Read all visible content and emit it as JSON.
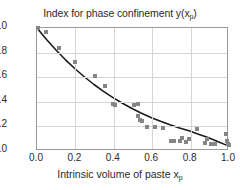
{
  "chart_data": {
    "type": "scatter",
    "title": "Index for phase confinement y(x",
    "title_sub": "p",
    "title_tail": ")",
    "xlabel": "Intrinsic volume of paste x",
    "xlabel_sub": "p",
    "ylabel": "",
    "xlim": [
      0.0,
      1.0
    ],
    "ylim": [
      0.0,
      1.0
    ],
    "xticks": [
      "0.0",
      "0.2",
      "0.4",
      "0.6",
      "0.8",
      "1.0"
    ],
    "xtick_values": [
      0.0,
      0.2,
      0.4,
      0.6,
      0.8,
      1.0
    ],
    "yticks": [
      "0.0",
      "0.2",
      "0.4",
      "0.6",
      "0.8",
      "1.0"
    ],
    "ytick_values": [
      0.0,
      0.2,
      0.4,
      0.6,
      0.8,
      1.0
    ],
    "grid": true,
    "legend": null,
    "marker_color": "#858585",
    "curve_color": "#1a1a1a",
    "grid_color": "#d5d5d5",
    "frame_color": "#9a9a9a",
    "series": [
      {
        "name": "measured index",
        "marker": "square",
        "points": [
          [
            0.005,
            1.0
          ],
          [
            0.045,
            0.965
          ],
          [
            0.115,
            0.84
          ],
          [
            0.2,
            0.72
          ],
          [
            0.3,
            0.61
          ],
          [
            0.355,
            0.525
          ],
          [
            0.395,
            0.385
          ],
          [
            0.405,
            0.375
          ],
          [
            0.505,
            0.375
          ],
          [
            0.525,
            0.385
          ],
          [
            0.525,
            0.285
          ],
          [
            0.535,
            0.255
          ],
          [
            0.545,
            0.245
          ],
          [
            0.575,
            0.195
          ],
          [
            0.615,
            0.195
          ],
          [
            0.655,
            0.185
          ],
          [
            0.7,
            0.085
          ],
          [
            0.715,
            0.085
          ],
          [
            0.745,
            0.085
          ],
          [
            0.755,
            0.105
          ],
          [
            0.775,
            0.075
          ],
          [
            0.79,
            0.095
          ],
          [
            0.835,
            0.175
          ],
          [
            0.875,
            0.065
          ],
          [
            0.885,
            0.095
          ],
          [
            0.905,
            0.055
          ],
          [
            0.925,
            0.055
          ],
          [
            0.985,
            0.135
          ],
          [
            0.99,
            0.085
          ],
          [
            0.995,
            0.055
          ],
          [
            1.0,
            0.045
          ]
        ]
      }
    ],
    "fit_curve": {
      "name": "fitted decay",
      "description": "monotonic exponential-like decay from 1.0 to about 0.03",
      "x": [
        0.0,
        0.05,
        0.1,
        0.15,
        0.2,
        0.25,
        0.3,
        0.35,
        0.4,
        0.45,
        0.5,
        0.55,
        0.6,
        0.65,
        0.7,
        0.75,
        0.8,
        0.85,
        0.9,
        0.95,
        1.0
      ],
      "y": [
        1.0,
        0.905,
        0.818,
        0.737,
        0.663,
        0.595,
        0.533,
        0.477,
        0.425,
        0.378,
        0.335,
        0.296,
        0.261,
        0.229,
        0.2,
        0.174,
        0.15,
        0.122,
        0.095,
        0.062,
        0.03
      ]
    }
  }
}
